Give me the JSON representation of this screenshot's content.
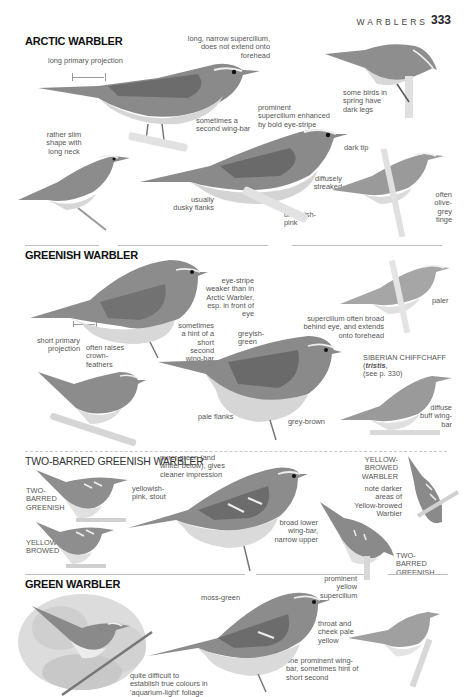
{
  "header": {
    "running_head": "WARBLERS",
    "page_number": "333"
  },
  "sections": [
    {
      "title": "ARCTIC WARBLER",
      "notes": [
        "long primary projection",
        "long, narrow supercilium, does not extend onto forehead",
        "some birds in spring have dark legs",
        "sometimes a second wing-bar",
        "prominent supercilium enhanced by bold eye-stripe",
        "dark tip",
        "rather slim shape with long neck",
        "diffusely streaked",
        "often olive-grey tinge",
        "usually dusky flanks",
        "brownish-pink"
      ]
    },
    {
      "title": "GREENISH WARBLER",
      "notes": [
        "eye-stripe weaker than in Arctic Warbler, esp. in front of eye",
        "paler",
        "short primary projection",
        "often raises crown-feathers",
        "sometimes a hint of a short second wing-bar",
        "greyish-green",
        "supercilium often broad behind eye, and extends onto forehead",
        "pale flanks",
        "grey-brown"
      ],
      "comparison": {
        "title": "SIBERIAN CHIFFCHAFF",
        "ref_species": "tristis",
        "ref_page": "see p. 330",
        "note": "diffuse buff wing-bar"
      }
    },
    {
      "title": "TWO-BARRED GREENISH WARBLER",
      "notes": [
        "purer green (and whiter below), gives cleaner impression",
        "yellowish-pink, stout",
        "broad lower wing-bar, narrow upper",
        "note darker areas of Yellow-browed Warbler"
      ],
      "labels": {
        "two_barred_left": "TWO-BARRED GREENISH",
        "yellow_browed_left": "YELLOW-BROWED",
        "yellow_browed_right": "YELLOW-BROWED WARBLER",
        "two_barred_right": "TWO-BARRED GREENISH"
      }
    },
    {
      "title": "GREEN WARBLER",
      "notes": [
        "moss-green",
        "prominent yellow supercilium",
        "throat and cheek pale yellow",
        "one prominent wing-bar, sometimes hint of short second",
        "quite difficult to establish true colours in 'aquarium-light' foliage"
      ]
    }
  ],
  "colors": {
    "ink": "#333333",
    "bird_dark": "#6e6e6e",
    "bird_mid": "#9a9a9a",
    "bird_light": "#d8d8d8",
    "divider": "#bdbdbd"
  }
}
